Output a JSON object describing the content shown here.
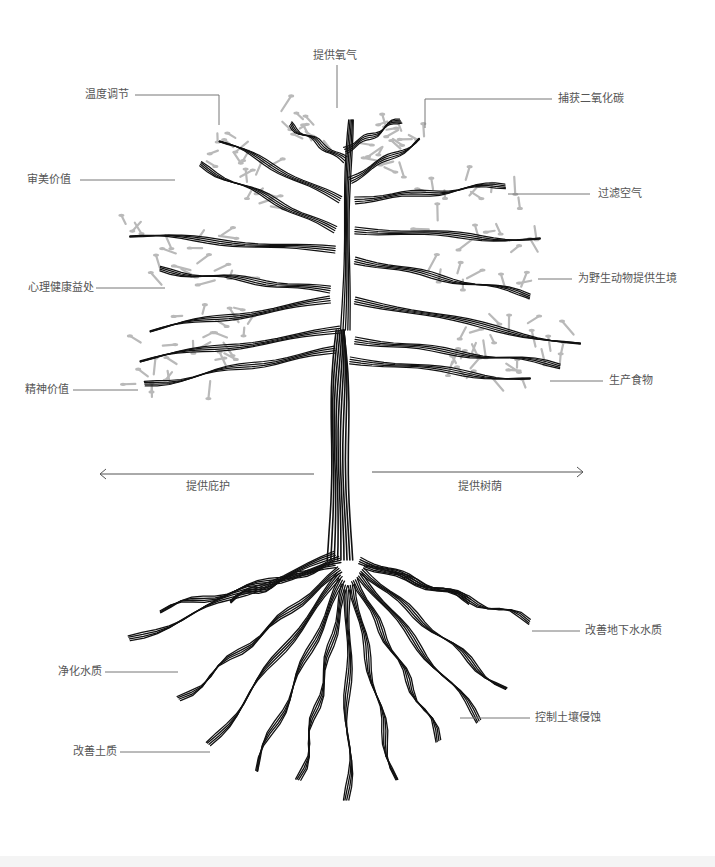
{
  "diagram": {
    "colors": {
      "trunk": "#111111",
      "leaves": "#b9b9b9",
      "leader_line": "#777777",
      "text": "#555555"
    },
    "crown_labels": [
      {
        "id": "oxygen",
        "text": "提供氧气"
      },
      {
        "id": "temperature",
        "text": "温度调节"
      },
      {
        "id": "carbon",
        "text": "捕获二氧化碳"
      },
      {
        "id": "aesthetic",
        "text": "审美价值"
      },
      {
        "id": "filter-air",
        "text": "过滤空气"
      },
      {
        "id": "mental-health",
        "text": "心理健康益处"
      },
      {
        "id": "habitat",
        "text": "为野生动物提供生境"
      },
      {
        "id": "spiritual",
        "text": "精神价值"
      },
      {
        "id": "food",
        "text": "生产食物"
      }
    ],
    "arrows": [
      {
        "id": "shelter",
        "text": "提供庇护",
        "direction": "left"
      },
      {
        "id": "shade",
        "text": "提供树荫",
        "direction": "right"
      }
    ],
    "root_labels": [
      {
        "id": "groundwater",
        "text": "改善地下水水质"
      },
      {
        "id": "water",
        "text": "净化水质"
      },
      {
        "id": "erosion",
        "text": "控制土壤侵蚀"
      },
      {
        "id": "soil",
        "text": "改善土质"
      }
    ]
  }
}
